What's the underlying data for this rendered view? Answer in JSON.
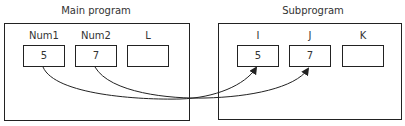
{
  "main": {
    "title": "Main program",
    "variables": [
      {
        "name": "Num1",
        "value": "5"
      },
      {
        "name": "Num2",
        "value": "7"
      },
      {
        "name": "L",
        "value": ""
      }
    ]
  },
  "sub": {
    "title": "Subprogram",
    "variables": [
      {
        "name": "I",
        "value": "5"
      },
      {
        "name": "J",
        "value": "7"
      },
      {
        "name": "K",
        "value": ""
      }
    ]
  },
  "links": [
    {
      "from": "Num1",
      "to": "I"
    },
    {
      "from": "Num2",
      "to": "J"
    }
  ],
  "colors": {
    "stroke": "#222222",
    "text": "#333333",
    "background": "#ffffff"
  }
}
